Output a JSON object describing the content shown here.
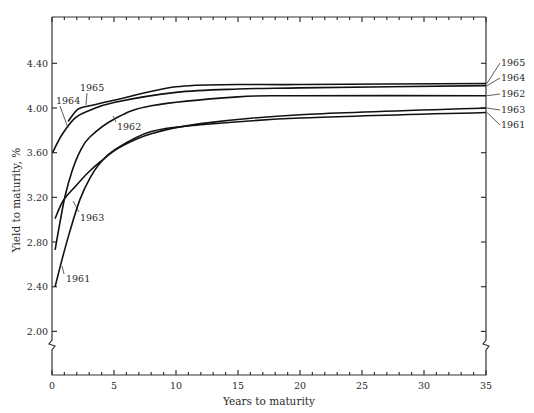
{
  "chart_data": {
    "type": "line",
    "title": "",
    "xlabel": "Years to maturity",
    "ylabel": "Yield to maturity, %",
    "xlim": [
      0,
      35
    ],
    "ylim": [
      1.6,
      4.8
    ],
    "x_ticks": [
      0,
      5,
      10,
      15,
      20,
      25,
      30,
      35
    ],
    "x_tick_labels": [
      "0",
      "5",
      "10",
      "15",
      "20",
      "25",
      "30",
      "35"
    ],
    "x_minor_step": 1,
    "y_ticks": [
      2.0,
      2.4,
      2.8,
      3.2,
      3.6,
      4.0,
      4.4
    ],
    "y_tick_labels": [
      "2.00",
      "2.40",
      "2.80",
      "3.20",
      "3.60",
      "4.00",
      "4.40"
    ],
    "axis_break": true,
    "grid": false,
    "legend": "inline labels on curves and at right edge",
    "series": [
      {
        "name": "1961",
        "x": [
          0.25,
          0.8,
          1.45,
          2.25,
          3.05,
          3.9,
          5.1,
          8,
          12,
          20,
          35
        ],
        "y": [
          2.4,
          2.64,
          2.9,
          3.18,
          3.37,
          3.51,
          3.63,
          3.79,
          3.85,
          3.91,
          3.96
        ]
      },
      {
        "name": "1962",
        "x": [
          0.25,
          0.65,
          1.05,
          1.6,
          2.25,
          3.05,
          5,
          8,
          15,
          20,
          35
        ],
        "y": [
          2.73,
          2.98,
          3.21,
          3.43,
          3.61,
          3.74,
          3.9,
          4.02,
          4.1,
          4.11,
          4.11
        ]
      },
      {
        "name": "1963",
        "x": [
          0.25,
          0.9,
          1.9,
          2.9,
          3.9,
          5.5,
          8,
          12,
          20,
          35
        ],
        "y": [
          3.01,
          3.17,
          3.3,
          3.42,
          3.52,
          3.65,
          3.77,
          3.86,
          3.94,
          4.0
        ]
      },
      {
        "name": "1964",
        "x": [
          0.05,
          0.8,
          1.85,
          3.05,
          5,
          10,
          15,
          20,
          35
        ],
        "y": [
          3.6,
          3.76,
          3.91,
          3.98,
          4.05,
          4.14,
          4.17,
          4.18,
          4.2
        ]
      },
      {
        "name": "1965",
        "x": [
          1.3,
          2.1,
          3.05,
          5,
          10,
          15,
          20,
          35
        ],
        "y": [
          3.88,
          3.99,
          4.02,
          4.07,
          4.19,
          4.21,
          4.21,
          4.22
        ]
      }
    ],
    "annotations": {
      "inline": [
        {
          "text": "1965",
          "series": "1965",
          "x": 2.7,
          "y": 4.02
        },
        {
          "text": "1964",
          "series": "1964",
          "x": 1.2,
          "y": 3.82
        },
        {
          "text": "1962",
          "series": "1962",
          "x": 5.1,
          "y": 3.92
        },
        {
          "text": "1963",
          "series": "1963",
          "x": 1.5,
          "y": 3.25
        },
        {
          "text": "1961",
          "series": "1961",
          "x": 0.9,
          "y": 2.62
        }
      ],
      "right_edge": [
        "1965",
        "1964",
        "1962",
        "1963",
        "1961"
      ]
    }
  }
}
